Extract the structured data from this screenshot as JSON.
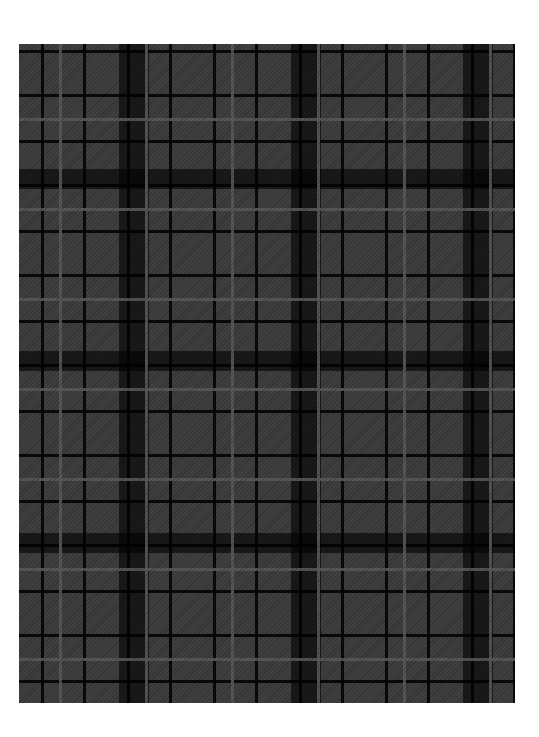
{
  "image": {
    "subject": "tartan-plaid-pattern",
    "colors": {
      "background": "#ffffff",
      "base": "#3f3f3f",
      "dark_stripe": "#0a0a0a",
      "light_line": "#5a5a5a"
    }
  }
}
